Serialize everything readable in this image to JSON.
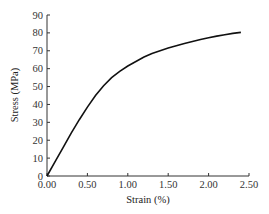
{
  "chart_data": {
    "type": "line",
    "title": "",
    "xlabel": "Strain (%)",
    "ylabel": "Stress (MPa)",
    "xlim": [
      0,
      2.5
    ],
    "ylim": [
      0,
      90
    ],
    "xticks": [
      "0.00",
      "0.50",
      "1.00",
      "1.50",
      "2.00",
      "2.50"
    ],
    "yticks": [
      "0",
      "10",
      "20",
      "30",
      "40",
      "50",
      "60",
      "70",
      "80",
      "90"
    ],
    "grid": false,
    "legend": null,
    "series": [
      {
        "name": "Stress-strain curve",
        "x": [
          0.0,
          0.1,
          0.2,
          0.3,
          0.4,
          0.5,
          0.6,
          0.7,
          0.8,
          0.9,
          1.0,
          1.1,
          1.2,
          1.3,
          1.4,
          1.5,
          1.6,
          1.7,
          1.8,
          1.9,
          2.0,
          2.1,
          2.2,
          2.3,
          2.4
        ],
        "y": [
          0,
          8,
          16,
          24,
          31.5,
          38.5,
          45,
          50.5,
          55,
          58.5,
          61.5,
          64,
          66.5,
          68.5,
          70,
          71.5,
          72.8,
          74,
          75.2,
          76.3,
          77.3,
          78.2,
          79,
          79.7,
          80.3
        ]
      }
    ]
  }
}
